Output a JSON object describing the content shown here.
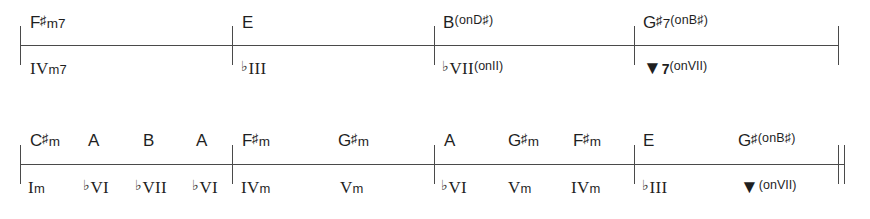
{
  "figure": {
    "type": "chord-chart",
    "ink_color": "#1f1f1f",
    "rule_color": "#4a4a4a",
    "systems": [
      {
        "id": "system-1",
        "barlines": [
          20,
          232,
          434,
          634,
          838
        ],
        "end_barline": "single",
        "measures": [
          {
            "index": 1,
            "chords": [
              {
                "x": 30,
                "root": "F",
                "accidental": "♯",
                "quality": "m7",
                "sup": "",
                "text": "F♯m7"
              }
            ],
            "numerals": [
              {
                "x": 30,
                "flat": "",
                "rn": "IV",
                "quality": "m7",
                "sup": "",
                "text": "IVm7"
              }
            ]
          },
          {
            "index": 2,
            "chords": [
              {
                "x": 242,
                "root": "E",
                "accidental": "",
                "quality": "",
                "sup": "",
                "text": "E"
              }
            ],
            "numerals": [
              {
                "x": 241,
                "flat": "♭",
                "rn": "III",
                "quality": "",
                "sup": "",
                "text": "♭III"
              }
            ]
          },
          {
            "index": 3,
            "chords": [
              {
                "x": 443,
                "root": "B",
                "accidental": "",
                "quality": "",
                "sup": "(onD♯)",
                "text": "B(onD♯)"
              }
            ],
            "numerals": [
              {
                "x": 442,
                "flat": "♭",
                "rn": "VII",
                "quality": "",
                "sup": "(onII)",
                "text": "♭VII(onII)"
              }
            ]
          },
          {
            "index": 4,
            "chords": [
              {
                "x": 643,
                "root": "G",
                "accidental": "♯",
                "quality": "7",
                "sup": "(onB♯)",
                "text": "G♯7(onB♯)"
              }
            ],
            "numerals": [
              {
                "x": 643,
                "flat": "",
                "rn": "▼",
                "quality": "7",
                "sup": "(onVII)",
                "text": "▼7(onVII)",
                "bold": true
              }
            ]
          }
        ]
      },
      {
        "id": "system-2",
        "barlines": [
          20,
          232,
          434,
          634,
          838
        ],
        "end_barline": "double",
        "measures": [
          {
            "index": 1,
            "chords": [
              {
                "x": 30,
                "root": "C",
                "accidental": "♯",
                "quality": "m",
                "sup": "",
                "text": "C♯m"
              },
              {
                "x": 88,
                "root": "A",
                "accidental": "",
                "quality": "",
                "sup": "",
                "text": "A"
              },
              {
                "x": 143,
                "root": "B",
                "accidental": "",
                "quality": "",
                "sup": "",
                "text": "B"
              },
              {
                "x": 196,
                "root": "A",
                "accidental": "",
                "quality": "",
                "sup": "",
                "text": "A"
              }
            ],
            "numerals": [
              {
                "x": 28,
                "flat": "",
                "rn": "I",
                "quality": "m",
                "sup": "",
                "text": "Im"
              },
              {
                "x": 83,
                "flat": "♭",
                "rn": "VI",
                "quality": "",
                "sup": "",
                "text": "♭VI"
              },
              {
                "x": 135,
                "flat": "♭",
                "rn": "VII",
                "quality": "",
                "sup": "",
                "text": "♭VII"
              },
              {
                "x": 192,
                "flat": "♭",
                "rn": "VI",
                "quality": "",
                "sup": "",
                "text": "♭VI"
              }
            ]
          },
          {
            "index": 2,
            "chords": [
              {
                "x": 242,
                "root": "F",
                "accidental": "♯",
                "quality": "m",
                "sup": "",
                "text": "F♯m"
              },
              {
                "x": 338,
                "root": "G",
                "accidental": "♯",
                "quality": "m",
                "sup": "",
                "text": "G♯m"
              }
            ],
            "numerals": [
              {
                "x": 241,
                "flat": "",
                "rn": "IV",
                "quality": "m",
                "sup": "",
                "text": "IVm"
              },
              {
                "x": 340,
                "flat": "",
                "rn": "V",
                "quality": "m",
                "sup": "",
                "text": "Vm"
              }
            ]
          },
          {
            "index": 3,
            "chords": [
              {
                "x": 444,
                "root": "A",
                "accidental": "",
                "quality": "",
                "sup": "",
                "text": "A"
              },
              {
                "x": 508,
                "root": "G",
                "accidental": "♯",
                "quality": "m",
                "sup": "",
                "text": "G♯m"
              },
              {
                "x": 573,
                "root": "F",
                "accidental": "♯",
                "quality": "m",
                "sup": "",
                "text": "F♯m"
              }
            ],
            "numerals": [
              {
                "x": 441,
                "flat": "♭",
                "rn": "VI",
                "quality": "",
                "sup": "",
                "text": "♭VI"
              },
              {
                "x": 508,
                "flat": "",
                "rn": "V",
                "quality": "m",
                "sup": "",
                "text": "Vm"
              },
              {
                "x": 571,
                "flat": "",
                "rn": "IV",
                "quality": "m",
                "sup": "",
                "text": "IVm"
              }
            ]
          },
          {
            "index": 4,
            "chords": [
              {
                "x": 643,
                "root": "E",
                "accidental": "",
                "quality": "",
                "sup": "",
                "text": "E"
              },
              {
                "x": 738,
                "root": "G",
                "accidental": "♯",
                "quality": "",
                "sup": "(onB♯)",
                "text": "G♯(onB♯)"
              }
            ],
            "numerals": [
              {
                "x": 642,
                "flat": "♭",
                "rn": "III",
                "quality": "",
                "sup": "",
                "text": "♭III"
              },
              {
                "x": 740,
                "flat": "",
                "rn": "▼",
                "quality": "",
                "sup": "(onVII)",
                "text": "▼(onVII)",
                "bold": true
              }
            ]
          }
        ]
      }
    ]
  }
}
